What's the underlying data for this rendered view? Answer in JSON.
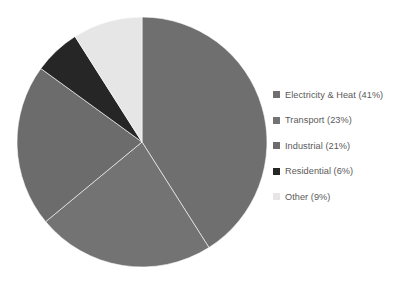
{
  "chart_data": {
    "type": "pie",
    "title": "",
    "subtitle": "",
    "xlabel": "",
    "ylabel": "",
    "legend_position": "right",
    "grid": false,
    "start_angle_deg": 0,
    "direction": "clockwise",
    "categories": [
      "Electricity & Heat",
      "Transport",
      "Industrial",
      "Residential",
      "Other"
    ],
    "values": [
      41,
      23,
      21,
      6,
      9
    ],
    "unit": "%",
    "slices": [
      {
        "label": "Electricity & Heat",
        "value": 41,
        "legend_text": "Electricity & Heat (41%)",
        "color": "#6f6f6f"
      },
      {
        "label": "Transport",
        "value": 23,
        "legend_text": "Transport (23%)",
        "color": "#737373"
      },
      {
        "label": "Industrial",
        "value": 21,
        "legend_text": "Industrial (21%)",
        "color": "#6c6c6c"
      },
      {
        "label": "Residential",
        "value": 6,
        "legend_text": "Residential (6%)",
        "color": "#262626"
      },
      {
        "label": "Other",
        "value": 9,
        "legend_text": "Other (9%)",
        "color": "#e6e6e6"
      }
    ],
    "geometry": {
      "center_x": 142,
      "center_y": 142,
      "radius": 125
    }
  },
  "legend": {
    "items": [
      {
        "swatch_name": "legend-swatch-electricity-heat",
        "text": "Electricity & Heat (41%)",
        "color": "#6f6f6f"
      },
      {
        "swatch_name": "legend-swatch-transport",
        "text": "Transport (23%)",
        "color": "#737373"
      },
      {
        "swatch_name": "legend-swatch-industrial",
        "text": "Industrial (21%)",
        "color": "#6c6c6c"
      },
      {
        "swatch_name": "legend-swatch-residential",
        "text": "Residential (6%)",
        "color": "#262626"
      },
      {
        "swatch_name": "legend-swatch-other",
        "text": "Other (9%)",
        "color": "#e6e6e6"
      }
    ]
  }
}
